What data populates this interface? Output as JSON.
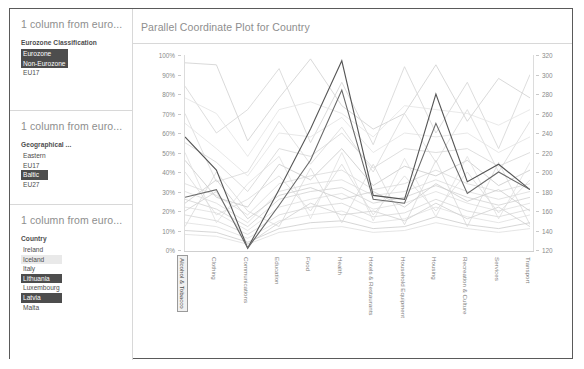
{
  "filters": [
    {
      "title": "1 column from euro...",
      "field_label": "Eurozone Classification",
      "options": [
        {
          "label": "Eurozone",
          "state": "selected"
        },
        {
          "label": "Non-Eurozone",
          "state": "selected"
        },
        {
          "label": "EU17",
          "state": "normal"
        }
      ]
    },
    {
      "title": "1 column from euro...",
      "field_label": "Geographical ...",
      "options": [
        {
          "label": "Eastern",
          "state": "normal"
        },
        {
          "label": "EU17",
          "state": "normal"
        },
        {
          "label": "Baltic",
          "state": "selected"
        },
        {
          "label": "EU27",
          "state": "normal"
        }
      ]
    },
    {
      "title": "1 column from euro...",
      "field_label": "Country",
      "options": [
        {
          "label": "Ireland",
          "state": "normal"
        },
        {
          "label": "Iceland",
          "state": "hover"
        },
        {
          "label": "Italy",
          "state": "normal"
        },
        {
          "label": "Lithuania",
          "state": "selected"
        },
        {
          "label": "Luxembourg",
          "state": "normal"
        },
        {
          "label": "Latvia",
          "state": "selected"
        },
        {
          "label": "Malta",
          "state": "normal"
        }
      ]
    }
  ],
  "chart_data": {
    "type": "line",
    "title": "Parallel Coordinate Plot for Country",
    "xlabel": "",
    "ylabel": "",
    "grid": false,
    "legend": "none",
    "categories": [
      "Alcohol & Tobacco",
      "Clothing",
      "Communications",
      "Education",
      "Food",
      "Health",
      "Hotels & Restaurants",
      "Household Equipment",
      "Housing",
      "Recreation & Culture",
      "Services",
      "Transport"
    ],
    "highlighted_category": "Alcohol & Tobacco",
    "axis_left": {
      "ticks": [
        "0%",
        "10%",
        "20%",
        "30%",
        "40%",
        "50%",
        "60%",
        "70%",
        "80%",
        "90%",
        "100%"
      ],
      "min": 0,
      "max": 100,
      "step": 10,
      "format": "percent"
    },
    "axis_right": {
      "ticks": [
        "120",
        "140",
        "160",
        "180",
        "200",
        "220",
        "240",
        "260",
        "280",
        "300",
        "320"
      ],
      "min": 120,
      "max": 320,
      "step": 20,
      "format": "number"
    },
    "series": [
      {
        "name": "Lithuania",
        "emphasis": "high",
        "color": "#555555",
        "values": [
          58,
          41,
          1,
          31,
          62,
          97,
          28,
          26,
          80,
          35,
          44,
          31
        ]
      },
      {
        "name": "Latvia",
        "emphasis": "high",
        "color": "#6a6a6a",
        "values": [
          27,
          31,
          1,
          23,
          46,
          82,
          26,
          24,
          65,
          29,
          40,
          31
        ]
      },
      {
        "name": "other-1",
        "emphasis": "low",
        "color": "#cfcfcf",
        "values": [
          96,
          95,
          56,
          78,
          98,
          74,
          62,
          70,
          95,
          66,
          88,
          78
        ]
      },
      {
        "name": "other-2",
        "emphasis": "low",
        "color": "#d4d4d4",
        "values": [
          84,
          60,
          72,
          93,
          55,
          86,
          54,
          94,
          60,
          86,
          52,
          90
        ]
      },
      {
        "name": "other-3",
        "emphasis": "low",
        "color": "#d9d9d9",
        "values": [
          70,
          35,
          40,
          66,
          44,
          63,
          40,
          70,
          45,
          72,
          40,
          66
        ]
      },
      {
        "name": "other-4",
        "emphasis": "low",
        "color": "#dcdcdc",
        "values": [
          30,
          24,
          14,
          30,
          34,
          36,
          28,
          30,
          36,
          30,
          26,
          30
        ]
      },
      {
        "name": "other-5",
        "emphasis": "low",
        "color": "#dedede",
        "values": [
          22,
          19,
          10,
          22,
          26,
          29,
          21,
          24,
          30,
          24,
          20,
          24
        ]
      },
      {
        "name": "other-6",
        "emphasis": "low",
        "color": "#d7d7d7",
        "values": [
          18,
          15,
          8,
          18,
          22,
          24,
          17,
          19,
          26,
          20,
          17,
          21
        ]
      },
      {
        "name": "other-7",
        "emphasis": "low",
        "color": "#e0e0e0",
        "values": [
          14,
          12,
          6,
          15,
          18,
          20,
          14,
          16,
          22,
          17,
          14,
          18
        ]
      },
      {
        "name": "other-8",
        "emphasis": "low",
        "color": "#d2d2d2",
        "values": [
          26,
          21,
          12,
          26,
          30,
          32,
          24,
          27,
          33,
          27,
          23,
          27
        ]
      },
      {
        "name": "other-9",
        "emphasis": "low",
        "color": "#dadada",
        "values": [
          34,
          28,
          18,
          34,
          38,
          41,
          31,
          34,
          41,
          34,
          30,
          34
        ]
      },
      {
        "name": "other-10",
        "emphasis": "low",
        "color": "#cccccc",
        "values": [
          10,
          9,
          4,
          11,
          14,
          15,
          11,
          12,
          17,
          13,
          11,
          14
        ]
      },
      {
        "name": "other-11",
        "emphasis": "low",
        "color": "#c9c9c9",
        "values": [
          46,
          27,
          22,
          44,
          36,
          52,
          33,
          43,
          38,
          46,
          33,
          41
        ]
      },
      {
        "name": "other-12",
        "emphasis": "low",
        "color": "#dedede",
        "values": [
          8,
          7,
          3,
          9,
          11,
          12,
          9,
          10,
          14,
          11,
          9,
          11
        ]
      },
      {
        "name": "other-13",
        "emphasis": "low",
        "color": "#d5d5d5",
        "values": [
          55,
          45,
          30,
          52,
          48,
          60,
          42,
          52,
          50,
          52,
          43,
          50
        ]
      },
      {
        "name": "other-14",
        "emphasis": "low",
        "color": "#e2e2e2",
        "values": [
          65,
          52,
          38,
          60,
          58,
          68,
          50,
          60,
          58,
          60,
          50,
          58
        ]
      },
      {
        "name": "other-15",
        "emphasis": "low",
        "color": "#d0d0d0",
        "values": [
          20,
          30,
          3,
          14,
          24,
          18,
          20,
          15,
          24,
          16,
          22,
          12
        ]
      },
      {
        "name": "other-16",
        "emphasis": "low",
        "color": "#dbdbdb",
        "values": [
          40,
          18,
          26,
          38,
          20,
          44,
          18,
          38,
          20,
          40,
          19,
          36
        ]
      },
      {
        "name": "other-17",
        "emphasis": "low",
        "color": "#d8d8d8",
        "values": [
          12,
          40,
          20,
          12,
          42,
          14,
          44,
          13,
          46,
          12,
          45,
          13
        ]
      },
      {
        "name": "other-18",
        "emphasis": "low",
        "color": "#e3e3e3",
        "values": [
          78,
          70,
          48,
          72,
          76,
          70,
          58,
          74,
          72,
          70,
          64,
          72
        ]
      },
      {
        "name": "other-19",
        "emphasis": "low",
        "color": "#cdcdcd",
        "values": [
          24,
          36,
          16,
          28,
          32,
          26,
          30,
          22,
          34,
          25,
          31,
          20
        ]
      },
      {
        "name": "other-20",
        "emphasis": "low",
        "color": "#dfdfdf",
        "values": [
          50,
          14,
          34,
          48,
          16,
          50,
          15,
          47,
          17,
          48,
          16,
          45
        ]
      }
    ]
  }
}
